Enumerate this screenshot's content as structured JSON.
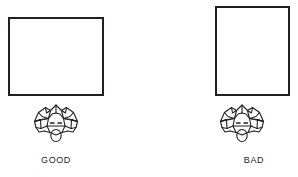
{
  "figure": {
    "background_color": "#ffffff",
    "ink_color": "#231f20",
    "panels": [
      {
        "id": "good",
        "caption": "GOOD",
        "screen": {
          "shape": "rectangle",
          "orientation": "landscape",
          "border_color": "#231f20"
        },
        "observer": {
          "icon": "overhead-head-and-shoulders-icon",
          "description": "person viewed from above facing the display"
        }
      },
      {
        "id": "bad",
        "caption": "BAD",
        "screen": {
          "shape": "rectangle",
          "orientation": "portrait",
          "border_color": "#231f20"
        },
        "observer": {
          "icon": "overhead-head-and-shoulders-icon",
          "description": "person viewed from above facing the display"
        }
      }
    ]
  }
}
